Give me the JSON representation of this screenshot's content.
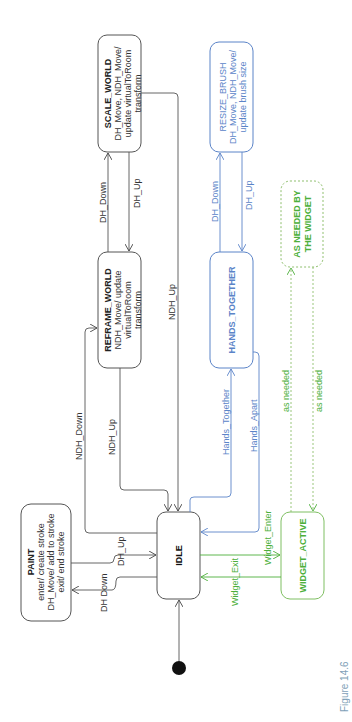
{
  "colors": {
    "black": "#333333",
    "blue": "#5b84c8",
    "green": "#4caf3a",
    "caption": "#7f9fb8"
  },
  "states": {
    "scale_world": {
      "title": "SCALE_WORLD",
      "line1": "DH_Move, NDH_Move/",
      "line2": "update virtualToRoom",
      "line3": "transform"
    },
    "reframe_world": {
      "title": "REFRAME_WORLD",
      "line1": "NDH_Move/ update",
      "line2": "virtualToRoom",
      "line3": "transform"
    },
    "paint": {
      "title": "PAINT",
      "line1": "enter/ create stroke",
      "line2": "DH_Move/ add to stroke",
      "line3": "exit/ end stroke"
    },
    "idle": {
      "title": "IDLE"
    },
    "resize_brush": {
      "title": "RESIZE_BRUSH",
      "line1": "DH_Move, NDH_Move/",
      "line2": "update brush size"
    },
    "hands_together": {
      "title": "HANDS_TOGETHER"
    },
    "as_needed": {
      "line1": "AS NEEDED BY",
      "line2": "THE WIDGET"
    },
    "widget_active": {
      "title": "WIDGET_ACTIVE"
    }
  },
  "transitions": {
    "reframe_to_scale": "DH_Down",
    "scale_to_reframe": "DH_Up",
    "scale_to_idle": "NDH_Up",
    "idle_to_reframe": "NDH_Down",
    "reframe_to_idle": "NDH_Up",
    "paint_to_idle": "DH_Up",
    "idle_to_paint": "DH Down",
    "hands_to_resize": "DH_Down",
    "resize_to_hands": "DH_Up",
    "idle_to_hands": "Hands_Together",
    "hands_to_idle": "Hands_Apart",
    "idle_to_widget": "Widget_Enter",
    "widget_to_idle": "Widget_Exit",
    "widget_to_asneeded": "as needed",
    "asneeded_to_widget": "as needed"
  },
  "caption": "Figure 14.6"
}
